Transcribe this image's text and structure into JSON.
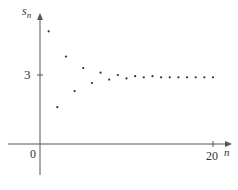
{
  "chart_data": {
    "type": "scatter",
    "title": "",
    "xlabel": "n",
    "ylabel": "s_n",
    "x_ticks": [
      0,
      20
    ],
    "y_ticks": [
      3
    ],
    "xlim": [
      -3.7,
      21.5
    ],
    "ylim": [
      -1.3,
      5.7
    ],
    "grid": false,
    "legend": null,
    "series": [
      {
        "name": "s_n",
        "x": [
          1,
          2,
          3,
          4,
          5,
          6,
          7,
          8,
          9,
          10,
          11,
          12,
          13,
          14,
          15,
          16,
          17,
          18,
          19,
          20
        ],
        "y": [
          4.9,
          1.6,
          3.8,
          2.3,
          3.3,
          2.65,
          3.1,
          2.8,
          3.0,
          2.85,
          2.95,
          2.9,
          2.95,
          2.9,
          2.9,
          2.9,
          2.9,
          2.9,
          2.9,
          2.9
        ]
      }
    ],
    "colors": {
      "axis": "#555555",
      "points": "#333333"
    }
  },
  "labels": {
    "y_axis_name": "s",
    "y_axis_sub": "n",
    "x_axis_name": "n",
    "origin": "0",
    "x_tick_20": "20",
    "y_tick_3": "3"
  }
}
